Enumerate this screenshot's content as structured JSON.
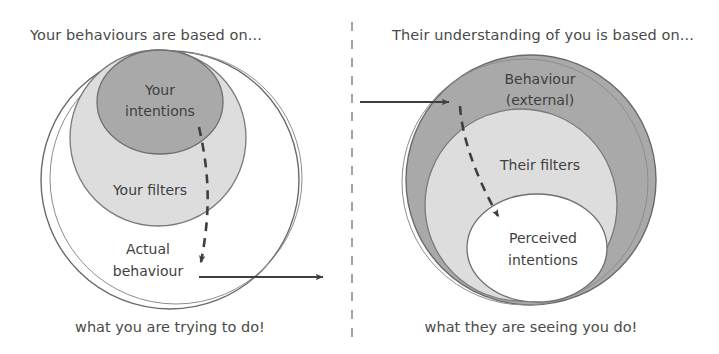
{
  "diagram": {
    "title_concept": "Intentions versus perceived behaviour model",
    "colors": {
      "dark_fill": "#a9a9a9",
      "light_fill": "#dddddd",
      "white_fill": "#ffffff",
      "stroke": "#555555",
      "text": "#4a4a4a",
      "divider": "#9a9a9a",
      "background": "#ffffff"
    },
    "divider": {
      "style": "dashed-vertical",
      "x": 352
    }
  },
  "left_panel": {
    "heading": "Your behaviours are based on...",
    "footer": "what you are trying to do!",
    "circles": [
      {
        "label": "Actual behaviour",
        "label_lines": [
          "Actual",
          "behaviour"
        ],
        "fill": "white",
        "level": "outer"
      },
      {
        "label": "Your filters",
        "label_lines": [
          "Your filters"
        ],
        "fill": "light-gray",
        "level": "middle"
      },
      {
        "label": "Your intentions",
        "label_lines": [
          "Your",
          "intentions"
        ],
        "fill": "dark-gray",
        "level": "inner"
      }
    ],
    "dashed_arrow": {
      "from": "Your intentions",
      "to": "Actual behaviour edge",
      "style": "dashed-with-arrowhead"
    },
    "out_arrow": {
      "style": "solid-with-arrowhead",
      "direction": "right"
    }
  },
  "right_panel": {
    "heading": "Their understanding of you is based on...",
    "footer": "what they are seeing you do!",
    "circles": [
      {
        "label": "Behaviour (external)",
        "label_lines": [
          "Behaviour",
          "(external)"
        ],
        "fill": "dark-gray",
        "level": "outer"
      },
      {
        "label": "Their filters",
        "label_lines": [
          "Their filters"
        ],
        "fill": "light-gray",
        "level": "middle"
      },
      {
        "label": "Perceived intentions",
        "label_lines": [
          "Perceived",
          "intentions"
        ],
        "fill": "white",
        "level": "inner"
      }
    ],
    "in_arrow": {
      "style": "solid-with-arrowhead",
      "direction": "right"
    },
    "dashed_arrow": {
      "from": "Behaviour (external)",
      "to": "Perceived intentions",
      "style": "dashed-with-arrowhead"
    }
  }
}
